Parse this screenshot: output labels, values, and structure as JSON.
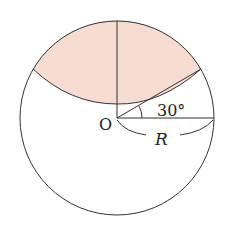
{
  "diagram": {
    "type": "geometry",
    "labels": {
      "center": "O",
      "angle": "30°",
      "radius": "R"
    },
    "colors": {
      "shade": "#f6dcd2",
      "stroke": "#333333"
    }
  }
}
